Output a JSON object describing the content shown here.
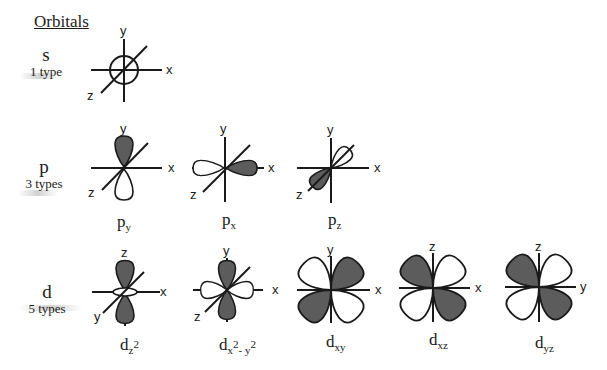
{
  "title": "Orbitals",
  "colors": {
    "shaded_lobe": "#5c5c5c",
    "open_lobe": "#ffffff",
    "line": "#1a1a1a"
  },
  "rows": [
    {
      "letter": "s",
      "types": "1 type",
      "orbitals": [
        {
          "name": "s",
          "axes": {
            "up": "y",
            "right": "x",
            "diag": "z"
          },
          "caption": ""
        }
      ]
    },
    {
      "letter": "p",
      "types": "3 types",
      "orbitals": [
        {
          "name": "py",
          "axes": {
            "up": "y",
            "right": "x",
            "diag": "z"
          },
          "caption_main": "p",
          "caption_sub": "y"
        },
        {
          "name": "px",
          "axes": {
            "up": "y",
            "right": "x",
            "diag": "z"
          },
          "caption_main": "p",
          "caption_sub": "x"
        },
        {
          "name": "pz",
          "axes": {
            "up": "y",
            "right": "x",
            "diag": "z"
          },
          "caption_main": "p",
          "caption_sub": "z"
        }
      ]
    },
    {
      "letter": "d",
      "types": "5 types",
      "orbitals": [
        {
          "name": "dz2",
          "axes": {
            "up": "z",
            "right": "x",
            "diag": "y"
          },
          "caption_main": "d",
          "caption_sub": "z",
          "caption_sup": "2"
        },
        {
          "name": "dx2-y2",
          "axes": {
            "up": "y",
            "right": "x",
            "diag": "z"
          },
          "caption_main": "d",
          "caption_sub": "x",
          "caption_sup": "2",
          "caption_sub2": "- y",
          "caption_sup2": "2"
        },
        {
          "name": "dxy",
          "axes": {
            "up": "y",
            "right": "x"
          },
          "caption_main": "d",
          "caption_sub": "xy"
        },
        {
          "name": "dxz",
          "axes": {
            "up": "z",
            "right": "x"
          },
          "caption_main": "d",
          "caption_sub": "xz"
        },
        {
          "name": "dyz",
          "axes": {
            "up": "z",
            "right": "y"
          },
          "caption_main": "d",
          "caption_sub": "yz"
        }
      ]
    }
  ]
}
